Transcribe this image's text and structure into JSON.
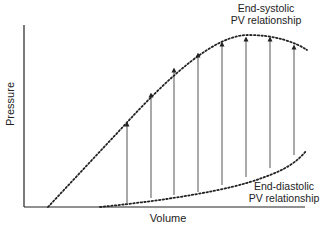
{
  "diagram": {
    "axes": {
      "x_label": "Volume",
      "y_label": "Pressure"
    },
    "curves": [
      {
        "name": "End-systolic PV relationship",
        "line1": "End-systolic",
        "line2": "PV relationship",
        "style": "dotted"
      },
      {
        "name": "End-diastolic PV relationship",
        "line1": "End-diastolic",
        "line2": "PV relationship",
        "style": "dotted"
      }
    ],
    "arrows": [
      {
        "x": 127,
        "y_bottom": 203,
        "y_top": 122
      },
      {
        "x": 151,
        "y_bottom": 198,
        "y_top": 93
      },
      {
        "x": 174,
        "y_bottom": 195,
        "y_top": 68
      },
      {
        "x": 198,
        "y_bottom": 192,
        "y_top": 53
      },
      {
        "x": 222,
        "y_bottom": 185,
        "y_top": 42
      },
      {
        "x": 246,
        "y_bottom": 177,
        "y_top": 37
      },
      {
        "x": 270,
        "y_bottom": 168,
        "y_top": 37
      },
      {
        "x": 294,
        "y_bottom": 155,
        "y_top": 45
      }
    ],
    "colors": {
      "line": "#222222",
      "arrow": "#555555",
      "background": "#ffffff"
    }
  }
}
